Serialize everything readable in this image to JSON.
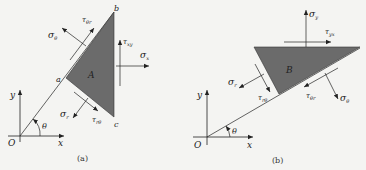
{
  "colors": {
    "background": "#f4f4f2",
    "element_fill": "#6b6b6b",
    "line": "#222222"
  },
  "panel_a": {
    "caption": "(a)",
    "element_label": "A",
    "vertex_labels": {
      "a": "a",
      "b": "b",
      "c": "c"
    },
    "origin": "O",
    "x_axis": "x",
    "y_axis": "y",
    "angle": "θ",
    "stresses": {
      "sigma_theta": {
        "sym": "σ",
        "sub": "θ"
      },
      "tau_theta_r": {
        "sym": "τ",
        "sub": "θr"
      },
      "tau_xy": {
        "sym": "τ",
        "sub": "xy"
      },
      "sigma_x": {
        "sym": "σ",
        "sub": "x"
      },
      "sigma_r": {
        "sym": "σ",
        "sub": "r"
      },
      "tau_r_theta": {
        "sym": "τ",
        "sub": "rθ"
      }
    }
  },
  "panel_b": {
    "caption": "(b)",
    "element_label": "B",
    "origin": "O",
    "x_axis": "x",
    "y_axis": "y",
    "angle": "θ",
    "stresses": {
      "sigma_y": {
        "sym": "σ",
        "sub": "y"
      },
      "tau_yx": {
        "sym": "τ",
        "sub": "yx"
      },
      "sigma_r": {
        "sym": "σ",
        "sub": "r"
      },
      "tau_r_theta": {
        "sym": "τ",
        "sub": "rθ"
      },
      "tau_theta_r": {
        "sym": "τ",
        "sub": "θr"
      },
      "sigma_theta": {
        "sym": "σ",
        "sub": "θ"
      }
    }
  }
}
